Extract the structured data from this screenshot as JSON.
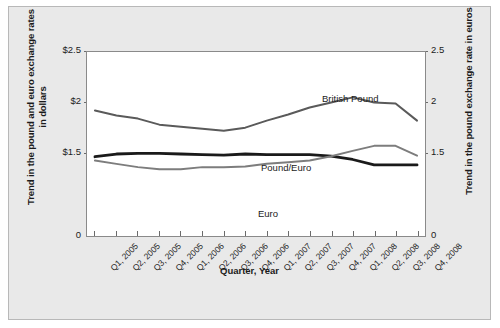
{
  "chart_data": {
    "type": "line",
    "title": "",
    "xlabel": "Quarter, Year",
    "ylabel": "Trend in the pound and euro exchange rates in dollars",
    "ylabel_right": "Trend in the pound exchange rate in euros",
    "categories": [
      "Q1, 2005",
      "Q2, 2005",
      "Q3, 2005",
      "Q4, 2005",
      "Q1, 2006",
      "Q2, 2006",
      "Q3, 2006",
      "Q4, 2006",
      "Q1, 2007",
      "Q2, 2007",
      "Q3, 2007",
      "Q4, 2007",
      "Q1, 2008",
      "Q2, 2008",
      "Q3, 2008",
      "Q4, 2008"
    ],
    "ylim": [
      0,
      2.5
    ],
    "yticks": [
      "$2.5",
      "$2",
      "$1.5",
      "0"
    ],
    "ytick_values": [
      2.5,
      2,
      1.5,
      0
    ],
    "yticks_right": [
      "2.5",
      "2",
      "1.5",
      "0"
    ],
    "ytick_values_right": [
      2.5,
      2,
      1.5,
      0
    ],
    "grid": false,
    "legend_position": "inline-labels",
    "series": [
      {
        "name": "British Pound",
        "color": "#5a5a5a",
        "width": 2.0,
        "values": [
          1.92,
          1.87,
          1.84,
          1.78,
          1.76,
          1.74,
          1.72,
          1.75,
          1.82,
          1.88,
          1.95,
          2.0,
          2.05,
          2.0,
          1.99,
          1.82
        ]
      },
      {
        "name": "Pound/Euro",
        "color": "#1a1a1a",
        "width": 2.8,
        "values": [
          1.43,
          1.48,
          1.49,
          1.49,
          1.48,
          1.47,
          1.46,
          1.48,
          1.47,
          1.47,
          1.47,
          1.44,
          1.38,
          1.28,
          1.28,
          1.28
        ]
      },
      {
        "name": "Euro",
        "color": "#7d7d7d",
        "width": 2.0,
        "values": [
          1.36,
          1.3,
          1.24,
          1.2,
          1.2,
          1.24,
          1.24,
          1.25,
          1.3,
          1.33,
          1.36,
          1.44,
          1.52,
          1.57,
          1.57,
          1.45
        ]
      }
    ],
    "series_label_positions": [
      {
        "name": "British Pound",
        "x": 313,
        "y": 86
      },
      {
        "name": "Pound/Euro",
        "x": 252,
        "y": 155
      },
      {
        "name": "Euro",
        "x": 249,
        "y": 201
      }
    ]
  },
  "colors": {
    "figure_background": "#e9e9e9",
    "plot_background": "#ffffff",
    "axis": "#8a8a8a",
    "text": "#1b1b1b"
  }
}
